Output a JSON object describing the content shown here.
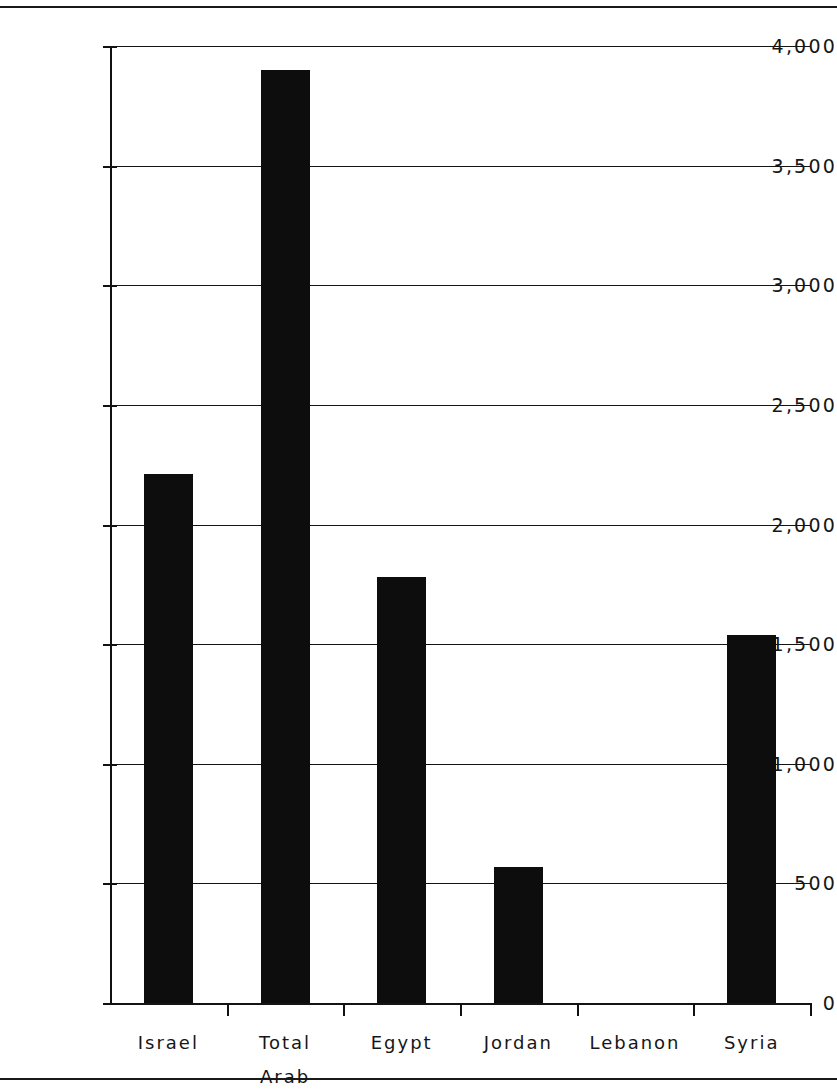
{
  "chart_data": {
    "type": "bar",
    "title": "",
    "subtitle": "",
    "xlabel": "",
    "ylabel": "",
    "categories": [
      "Israel",
      "Total\nArab",
      "Egypt",
      "Jordan",
      "Lebanon",
      "Syria"
    ],
    "values": [
      2210,
      3900,
      1780,
      570,
      0,
      1540
    ],
    "series": [
      {
        "name": "",
        "values": [
          2210,
          3900,
          1780,
          570,
          0,
          1540
        ]
      }
    ],
    "ylim": [
      0,
      4000
    ],
    "ytick_values": [
      0,
      500,
      1000,
      1500,
      2000,
      2500,
      3000,
      3500,
      4000
    ],
    "ytick_labels": [
      "0",
      "500",
      "1,000",
      "1,500",
      "2,000",
      "2,500",
      "3,000",
      "3,500",
      "4,000"
    ],
    "grid": true,
    "grid_axis": "y",
    "legend": false,
    "legend_position": "none",
    "bar_color": "#0d0d0d",
    "axis_color": "#111111",
    "background_color": "#ffffff",
    "annotations": []
  },
  "rules": {
    "top_rule": "horizontal-rule",
    "bottom_rule": "horizontal-rule"
  }
}
